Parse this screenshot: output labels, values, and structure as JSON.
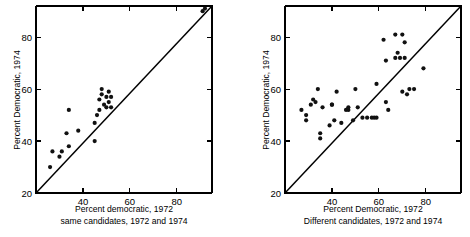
{
  "figure": {
    "background_color": "#ffffff",
    "ink_color": "#000000",
    "point_color": "#111111"
  },
  "chart_data": [
    {
      "type": "scatter",
      "panel": "left",
      "title": "",
      "xlabel": "Percent democratic, 1972",
      "sublabel": "same candidates, 1972 and 1974",
      "ylabel": "Percent Democratic, 1974",
      "xlim": [
        20,
        95
      ],
      "ylim": [
        20,
        92
      ],
      "xticks": [
        40,
        60,
        80
      ],
      "xtick_labels": [
        "40",
        "60",
        "80"
      ],
      "yticks": [
        20,
        40,
        60,
        80
      ],
      "ytick_labels": [
        "20",
        "40",
        "60",
        "80"
      ],
      "grid": false,
      "legend": "none",
      "reference_line": {
        "type": "identity",
        "label": "45-degree line",
        "from": [
          20,
          20
        ],
        "to": [
          92,
          92
        ]
      },
      "x": [
        26,
        27,
        30,
        31,
        33,
        34,
        34,
        38,
        45,
        45,
        46,
        47,
        47,
        48,
        48,
        49,
        50,
        50,
        51,
        51,
        52,
        52,
        91,
        92
      ],
      "y": [
        30,
        36,
        34,
        36,
        43,
        38,
        52,
        44,
        40,
        47,
        50,
        52,
        56,
        58,
        60,
        54,
        57,
        53,
        59,
        55,
        57,
        53,
        90,
        91
      ],
      "n_points": 24
    },
    {
      "type": "scatter",
      "panel": "right",
      "title": "",
      "xlabel": "Percent Democratic, 1972",
      "sublabel": "Different candidates, 1972 and 1974",
      "ylabel": "Percent Democratic, 1974",
      "xlim": [
        20,
        95
      ],
      "ylim": [
        20,
        92
      ],
      "xticks": [
        40,
        60,
        80
      ],
      "xtick_labels": [
        "40",
        "60",
        "80"
      ],
      "yticks": [
        20,
        40,
        60,
        80
      ],
      "ytick_labels": [
        "20",
        "40",
        "60",
        "80"
      ],
      "grid": false,
      "legend": "none",
      "reference_line": {
        "type": "identity",
        "label": "45-degree line",
        "from": [
          20,
          20
        ],
        "to": [
          92,
          92
        ]
      },
      "x": [
        27,
        29,
        29,
        31,
        32,
        33,
        34,
        35,
        35,
        36,
        39,
        40,
        40,
        41,
        42,
        44,
        46,
        47,
        47,
        49,
        50,
        51,
        53,
        55,
        57,
        58,
        59,
        59,
        62,
        63,
        63,
        64,
        67,
        67,
        68,
        69,
        70,
        70,
        71,
        71,
        72,
        73,
        75,
        79
      ],
      "y": [
        52,
        50,
        48,
        54,
        56,
        55,
        60,
        43,
        41,
        53,
        46,
        54,
        54,
        48,
        59,
        47,
        52,
        52,
        53,
        48,
        60,
        53,
        49,
        49,
        49,
        49,
        62,
        49,
        79,
        71,
        55,
        52,
        81,
        72,
        74,
        72,
        81,
        59,
        78,
        72,
        58,
        60,
        60,
        68
      ],
      "n_points": 44
    }
  ]
}
